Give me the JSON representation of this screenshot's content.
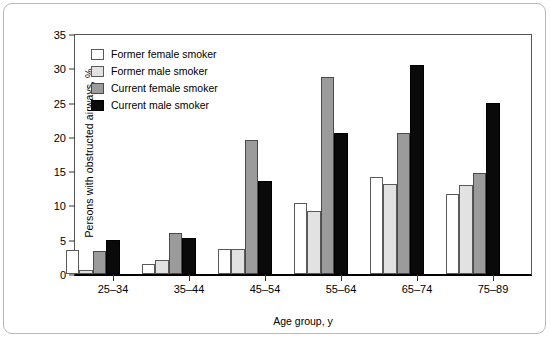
{
  "chart_data": {
    "type": "bar",
    "title": "",
    "xlabel": "Age group, y",
    "ylabel": "Persons with obstructed airways, %",
    "categories": [
      "25–34",
      "35–44",
      "45–54",
      "55–64",
      "65–74",
      "75–89"
    ],
    "series": [
      {
        "name": "Former female smoker",
        "color": "#ffffff",
        "values": [
          3.5,
          1.5,
          3.7,
          10.4,
          14.1,
          11.7
        ]
      },
      {
        "name": "Former male smoker",
        "color": "#e2e2e2",
        "values": [
          0.6,
          2.0,
          3.7,
          9.2,
          13.2,
          13.0
        ]
      },
      {
        "name": "Current female smoker",
        "color": "#9b9b9b",
        "values": [
          3.4,
          6.0,
          19.5,
          28.8,
          20.6,
          14.8
        ]
      },
      {
        "name": "Current male smoker",
        "color": "#0a0a0a",
        "values": [
          4.9,
          5.2,
          13.5,
          20.5,
          30.5,
          25.0
        ]
      }
    ],
    "ylim": [
      0,
      35
    ],
    "yticks": [
      0,
      5,
      10,
      15,
      20,
      25,
      30,
      35
    ],
    "ytick_labels": [
      "0",
      "5",
      "10",
      "15",
      "20",
      "25",
      "30",
      "35"
    ],
    "grid": false,
    "legend_position": "top-left-inside"
  }
}
